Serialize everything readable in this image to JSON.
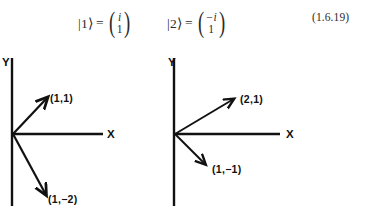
{
  "equation": {
    "ket_1": {
      "label": "|1⟩",
      "equals": "=",
      "vector_top": "i",
      "vector_bottom": "1"
    },
    "ket_2": {
      "label": "|2⟩",
      "equals": "=",
      "vector_top": "−i",
      "vector_bottom": "1"
    },
    "number": "(1.6.19)"
  },
  "diagrams": [
    {
      "name": "left-diagram",
      "y_axis_label": "Y",
      "x_axis_label": "X",
      "vectors": [
        {
          "label": "(1,1)",
          "components": [
            1,
            1
          ]
        },
        {
          "label": "(1,−2)",
          "components": [
            1,
            -2
          ]
        }
      ]
    },
    {
      "name": "right-diagram",
      "y_axis_label": "Y",
      "x_axis_label": "X",
      "vectors": [
        {
          "label": "(2,1)",
          "components": [
            2,
            1
          ]
        },
        {
          "label": "(1,−1)",
          "components": [
            1,
            -1
          ]
        }
      ]
    }
  ],
  "colors": {
    "ink": "#111111",
    "equation_ink": "#2b2b2b",
    "background": "#ffffff"
  }
}
